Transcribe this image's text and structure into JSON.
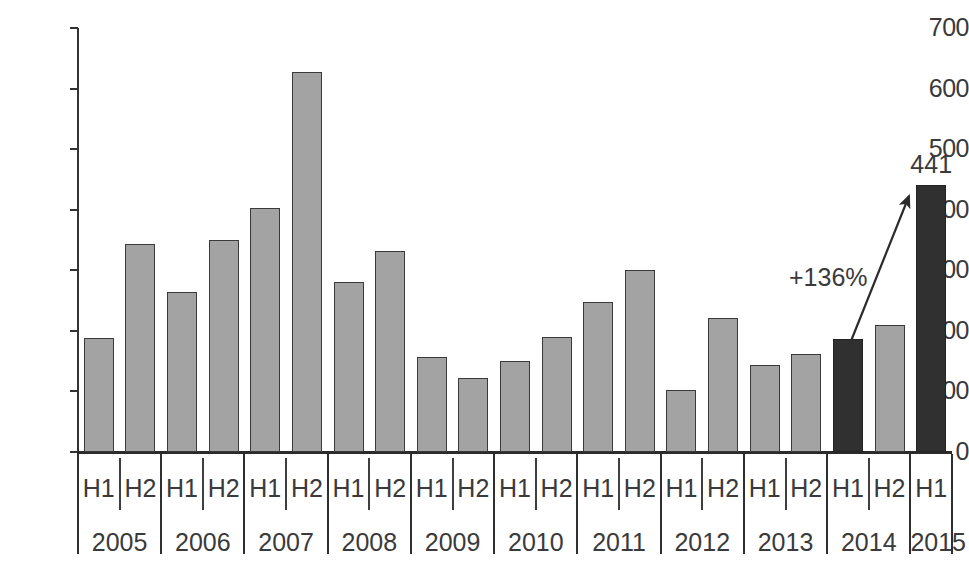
{
  "chart_data": {
    "type": "bar",
    "title": "",
    "subtitle": "",
    "xlabel": "",
    "ylabel": "",
    "ylim": [
      0,
      700
    ],
    "y_ticks": [
      0,
      100,
      200,
      300,
      400,
      500,
      600,
      700
    ],
    "grid": false,
    "legend": "none",
    "categories": [
      "2005 H1",
      "2005 H2",
      "2006 H1",
      "2006 H2",
      "2007 H1",
      "2007 H2",
      "2008 H1",
      "2008 H2",
      "2009 H1",
      "2009 H2",
      "2010 H1",
      "2010 H2",
      "2011 H1",
      "2011 H2",
      "2012 H1",
      "2012 H2",
      "2013 H1",
      "2013 H2",
      "2014 H1",
      "2014 H2",
      "2015 H1"
    ],
    "values": [
      188,
      344,
      265,
      350,
      403,
      627,
      280,
      332,
      157,
      122,
      151,
      190,
      247,
      300,
      102,
      222,
      144,
      162,
      187,
      210,
      441
    ],
    "bar_styles": [
      "light",
      "light",
      "light",
      "light",
      "light",
      "light",
      "light",
      "light",
      "light",
      "light",
      "light",
      "light",
      "light",
      "light",
      "light",
      "light",
      "light",
      "light",
      "dark",
      "light",
      "dark"
    ],
    "data_labels": [
      null,
      null,
      null,
      null,
      null,
      null,
      null,
      null,
      null,
      null,
      null,
      null,
      null,
      null,
      null,
      null,
      null,
      null,
      null,
      null,
      "441"
    ],
    "annotations": [
      {
        "text": "+136%",
        "from_category": "2014 H1",
        "to_category": "2015 H1",
        "kind": "growth-arrow"
      }
    ],
    "x_axis_groups": [
      {
        "year": "2005",
        "halves": [
          "H1",
          "H2"
        ]
      },
      {
        "year": "2006",
        "halves": [
          "H1",
          "H2"
        ]
      },
      {
        "year": "2007",
        "halves": [
          "H1",
          "H2"
        ]
      },
      {
        "year": "2008",
        "halves": [
          "H1",
          "H2"
        ]
      },
      {
        "year": "2009",
        "halves": [
          "H1",
          "H2"
        ]
      },
      {
        "year": "2010",
        "halves": [
          "H1",
          "H2"
        ]
      },
      {
        "year": "2011",
        "halves": [
          "H1",
          "H2"
        ]
      },
      {
        "year": "2012",
        "halves": [
          "H1",
          "H2"
        ]
      },
      {
        "year": "2013",
        "halves": [
          "H1",
          "H2"
        ]
      },
      {
        "year": "2014",
        "halves": [
          "H1",
          "H2"
        ]
      },
      {
        "year": "2015",
        "halves": [
          "H1"
        ]
      }
    ],
    "colors": {
      "bar_light": "#a3a3a3",
      "bar_dark": "#303030",
      "bar_border": "#3a3a3a",
      "axis": "#2b2b2b",
      "text": "#3a3a3a",
      "background": "#ffffff"
    }
  }
}
